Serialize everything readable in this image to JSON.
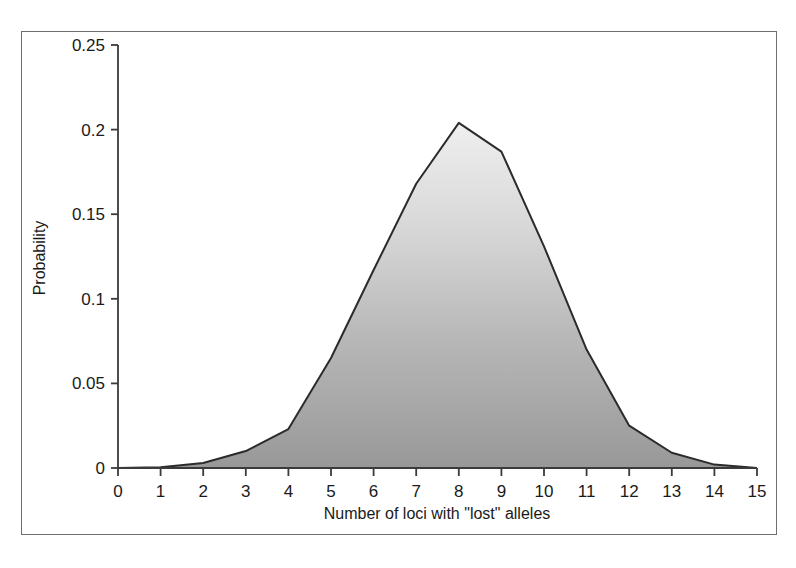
{
  "chart_data": {
    "type": "area",
    "title": "",
    "xlabel": "Number of loci with \"lost\" alleles",
    "ylabel": "Probability",
    "x": [
      0,
      1,
      2,
      3,
      4,
      5,
      6,
      7,
      8,
      9,
      10,
      11,
      12,
      13,
      14,
      15
    ],
    "values": [
      0.0,
      0.0005,
      0.003,
      0.01,
      0.023,
      0.065,
      0.117,
      0.168,
      0.204,
      0.187,
      0.131,
      0.07,
      0.025,
      0.009,
      0.002,
      0.0
    ],
    "series": [
      {
        "name": "Probability",
        "values": [
          0.0,
          0.0005,
          0.003,
          0.01,
          0.023,
          0.065,
          0.117,
          0.168,
          0.204,
          0.187,
          0.131,
          0.07,
          0.025,
          0.009,
          0.002,
          0.0
        ]
      }
    ],
    "xlim": [
      0,
      15
    ],
    "ylim": [
      0,
      0.25
    ],
    "xticks": [
      0,
      1,
      2,
      3,
      4,
      5,
      6,
      7,
      8,
      9,
      10,
      11,
      12,
      13,
      14,
      15
    ],
    "xtick_labels": [
      "0",
      "1",
      "2",
      "3",
      "4",
      "5",
      "6",
      "7",
      "8",
      "9",
      "10",
      "11",
      "12",
      "13",
      "14",
      "15"
    ],
    "yticks": [
      0,
      0.05,
      0.1,
      0.15,
      0.2,
      0.25
    ],
    "ytick_labels": [
      "0",
      "0.05",
      "0.1",
      "0.15",
      "0.2",
      "0.25"
    ],
    "grid": false,
    "legend": false,
    "legend_position": "none",
    "colors": {
      "line": "#2b2b2b",
      "fill_top": "#ececec",
      "fill_bottom": "#9a9a9a",
      "axis": "#3a3a3a",
      "frame": "#6e6e6e",
      "background": "#ffffff",
      "text": "#1a1a1a"
    }
  },
  "axes": {
    "y_title": "Probability",
    "x_title": "Number of loci with \"lost\" alleles",
    "y_tick_labels": [
      "0.25",
      "0.2",
      "0.15",
      "0.1",
      "0.05",
      "0"
    ],
    "x_tick_labels": [
      "0",
      "1",
      "2",
      "3",
      "4",
      "5",
      "6",
      "7",
      "8",
      "9",
      "10",
      "11",
      "12",
      "13",
      "14",
      "15"
    ]
  }
}
